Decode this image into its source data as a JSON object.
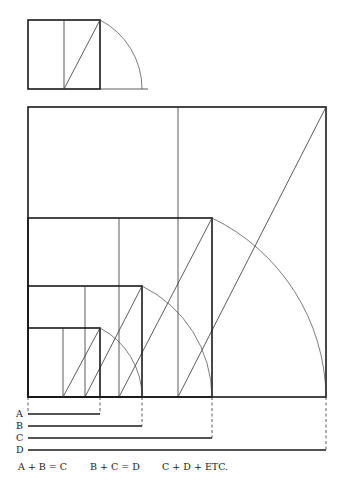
{
  "colors": {
    "ink": "#1a1a1a",
    "background": "#ffffff"
  },
  "small_figure": {
    "square": {
      "x": 28,
      "y": 20,
      "size": 72,
      "height": 69
    },
    "midline_x": 64,
    "diagonal": [
      64,
      89,
      100,
      20
    ],
    "arc": {
      "cx": 64,
      "cy": 89,
      "r": 78,
      "start": [
        100,
        20
      ],
      "end": [
        142,
        89
      ]
    },
    "baseline_end_x": 148
  },
  "main_figure": {
    "baseline_y": 397,
    "left_x": 28,
    "squares": [
      {
        "name": "D-square",
        "right": 326,
        "top": 107,
        "midline_x": 178
      },
      {
        "name": "C-square",
        "right": 212,
        "top": 218,
        "midline_x": 119
      },
      {
        "name": "B-square",
        "right": 142,
        "top": 286,
        "midline_x": 85
      },
      {
        "name": "A-square",
        "right": 100,
        "top": 328,
        "midline_x": 63
      }
    ],
    "arcs": [
      {
        "cx": 63,
        "cy": 397,
        "from": [
          100,
          328
        ],
        "to": [
          142,
          397
        ]
      },
      {
        "cx": 85,
        "cy": 397,
        "from": [
          142,
          286
        ],
        "to": [
          212,
          397
        ]
      },
      {
        "cx": 119,
        "cy": 397,
        "from": [
          212,
          218
        ],
        "to": [
          326,
          397
        ]
      }
    ]
  },
  "measures": [
    {
      "label": "A",
      "y": 414,
      "end_x": 100
    },
    {
      "label": "B",
      "y": 426,
      "end_x": 142
    },
    {
      "label": "C",
      "y": 438,
      "end_x": 212
    },
    {
      "label": "D",
      "y": 450,
      "end_x": 326
    }
  ],
  "formulas": [
    {
      "text": "A + B = C",
      "x": 18
    },
    {
      "text": "B + C = D",
      "x": 90
    },
    {
      "text": "C + D + ETC.",
      "x": 162
    }
  ],
  "formula_y": 462
}
